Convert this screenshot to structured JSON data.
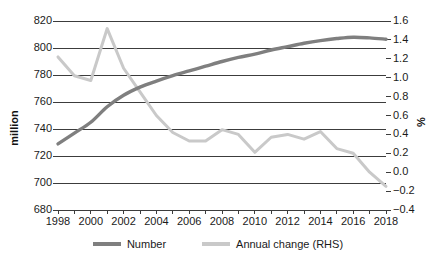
{
  "chart_data": {
    "type": "line",
    "title": "",
    "xlabel": "",
    "ylabel": "million",
    "ylabel_right": "%",
    "grid": true,
    "legend_position": "bottom",
    "x": [
      1998,
      1999,
      2000,
      2001,
      2002,
      2003,
      2004,
      2005,
      2006,
      2007,
      2008,
      2009,
      2010,
      2011,
      2012,
      2013,
      2014,
      2015,
      2016,
      2017,
      2018
    ],
    "xtick_labels": [
      "1998",
      "2000",
      "2002",
      "2004",
      "2006",
      "2008",
      "2010",
      "2012",
      "2014",
      "2016",
      "2018"
    ],
    "xtick_values": [
      1998,
      2000,
      2002,
      2004,
      2006,
      2008,
      2010,
      2012,
      2014,
      2016,
      2018
    ],
    "xlim": [
      1998,
      2018
    ],
    "ylim": [
      680,
      820
    ],
    "ytick_labels": [
      "680",
      "700",
      "720",
      "740",
      "760",
      "780",
      "800",
      "820"
    ],
    "ytick_values": [
      680,
      700,
      720,
      740,
      760,
      780,
      800,
      820
    ],
    "ylim_right": [
      -0.4,
      1.6
    ],
    "ytick_labels_right": [
      "-0.4",
      "-0.2",
      "0.0",
      "0.2",
      "0.4",
      "0.6",
      "0.8",
      "1.0",
      "1.2",
      "1.4",
      "1.6"
    ],
    "ytick_values_right": [
      -0.4,
      -0.2,
      0.0,
      0.2,
      0.4,
      0.6,
      0.8,
      1.0,
      1.2,
      1.4,
      1.6
    ],
    "series": [
      {
        "name": "Number",
        "axis": "left",
        "color": "#7f7f7f",
        "width": 3.4,
        "values": [
          729.0,
          737.0,
          745.0,
          756.5,
          765.0,
          771.0,
          775.5,
          779.5,
          783.0,
          786.5,
          790.0,
          793.0,
          795.5,
          798.5,
          801.0,
          803.5,
          805.5,
          807.0,
          808.0,
          807.5,
          806.5
        ]
      },
      {
        "name": "Annual change (RHS)",
        "axis": "right",
        "color": "#c9c9c9",
        "width": 3.0,
        "values": [
          1.22,
          1.02,
          0.97,
          1.52,
          1.1,
          0.85,
          0.6,
          0.42,
          0.33,
          0.33,
          0.45,
          0.4,
          0.21,
          0.37,
          0.4,
          0.35,
          0.43,
          0.25,
          0.2,
          0.0,
          -0.15
        ]
      }
    ],
    "legend": [
      {
        "label": "Number",
        "color": "#7f7f7f"
      },
      {
        "label": "Annual change (RHS)",
        "color": "#c9c9c9"
      }
    ],
    "colors": {
      "number_line": "#7f7f7f",
      "annual_change_line": "#c9c9c9",
      "gridline": "#3c3c3c",
      "text": "#1a1a1a",
      "background": "#ffffff"
    }
  }
}
